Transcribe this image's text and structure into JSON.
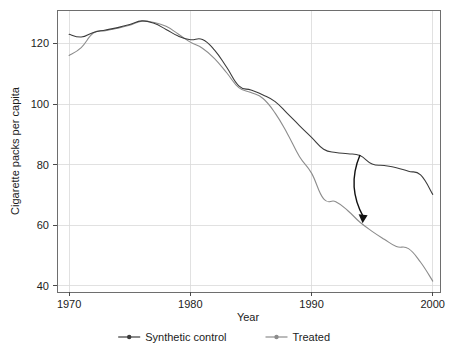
{
  "chart_data": {
    "type": "line",
    "title": "",
    "xlabel": "Year",
    "ylabel": "Cigarette packs per capita",
    "xlim": [
      1969,
      2000.6
    ],
    "ylim": [
      38,
      131
    ],
    "xticks": [
      1970,
      1980,
      1990,
      2000
    ],
    "xtick_labels": [
      "1970",
      "1980",
      "1990",
      "2000"
    ],
    "yticks": [
      40,
      60,
      80,
      100,
      120
    ],
    "ytick_labels": [
      "40",
      "60",
      "80",
      "100",
      "120"
    ],
    "grid": true,
    "legend_position": "bottom",
    "x": [
      1970,
      1971,
      1972,
      1973,
      1974,
      1975,
      1976,
      1977,
      1978,
      1979,
      1980,
      1981,
      1982,
      1983,
      1984,
      1985,
      1986,
      1987,
      1988,
      1989,
      1990,
      1991,
      1992,
      1993,
      1994,
      1995,
      1996,
      1997,
      1998,
      1999,
      2000
    ],
    "series": [
      {
        "name": "Synthetic control",
        "color": "#3c3c3c",
        "marker": "circle",
        "values": [
          123.0,
          122.1,
          123.6,
          124.4,
          125.2,
          126.2,
          127.4,
          126.6,
          124.6,
          122.4,
          121.2,
          121.3,
          117.8,
          112.1,
          106.0,
          104.6,
          103.0,
          100.8,
          96.9,
          92.9,
          89.0,
          85.1,
          84.0,
          83.6,
          83.0,
          80.2,
          79.7,
          79.0,
          77.8,
          76.6,
          70.2
        ]
      },
      {
        "name": "Treated",
        "color": "#8c8c8c",
        "marker": "circle",
        "values": [
          116.0,
          118.6,
          123.4,
          124.2,
          125.0,
          126.0,
          127.3,
          126.9,
          125.6,
          123.1,
          120.4,
          118.4,
          115.0,
          110.3,
          105.4,
          103.8,
          101.8,
          97.0,
          90.3,
          82.7,
          77.2,
          68.7,
          67.8,
          64.8,
          61.0,
          58.0,
          55.4,
          53.0,
          52.3,
          47.8,
          41.6
        ]
      }
    ],
    "annotation": {
      "type": "curved-arrow",
      "from": {
        "x": 1994.0,
        "y": 83.2
      },
      "to": {
        "x": 1994.3,
        "y": 61.3
      },
      "label": ""
    }
  },
  "legend": {
    "items": [
      {
        "label": "Synthetic control",
        "color": "#3c3c3c"
      },
      {
        "label": "Treated",
        "color": "#8c8c8c"
      }
    ]
  }
}
